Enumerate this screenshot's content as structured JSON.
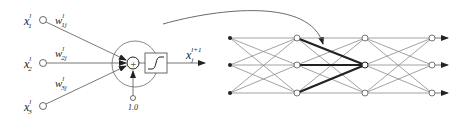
{
  "neuron": {
    "inputs": [
      {
        "label": "x",
        "sup": "l",
        "sub": "1",
        "weight": "w",
        "weight_sup": "l",
        "weight_sub": "1j"
      },
      {
        "label": "x",
        "sup": "l",
        "sub": "2",
        "weight": "w",
        "weight_sup": "l",
        "weight_sub": "2j"
      },
      {
        "label": "x",
        "sup": "l",
        "sub": "3",
        "weight": "w",
        "weight_sup": "l",
        "weight_sub": "3j"
      }
    ],
    "sum_symbol": "+",
    "bias_label": "1.0",
    "output": {
      "label": "x",
      "sup": "l+1",
      "sub": "j"
    },
    "activation": "sigmoid-icon"
  },
  "network": {
    "layers": 4,
    "nodes_per_layer": 3,
    "highlighted_node": {
      "layer": 3,
      "index": 2
    },
    "colors": {
      "edges": "#8a8a8a",
      "highlight": "#222222",
      "node_fill": "#ffffff"
    }
  }
}
